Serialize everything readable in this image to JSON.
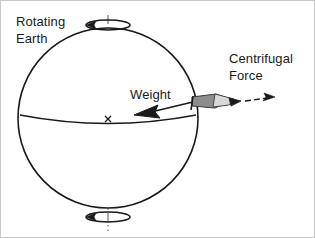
{
  "figure": {
    "background_color": "#ffffff",
    "border_color": "#c8c8c8",
    "line_color": "#1a1a1a"
  },
  "labels": {
    "rotating_earth_line1": "Rotating",
    "rotating_earth_line2": "Earth",
    "weight": "Weight",
    "centrifugal_line1": "Centrifugal",
    "centrifugal_line2": "Force"
  },
  "diagram": {
    "sphere": {
      "name": "Earth",
      "center_x": 107,
      "center_y": 117,
      "radius": 90,
      "stroke": "#1a1a1a"
    },
    "equator": {
      "name": "Equator",
      "start_x": 19,
      "start_y": 117,
      "end_x": 195,
      "end_y": 117,
      "sag": 9
    },
    "rotation_axis": {
      "name": "Rotation axis",
      "x": 107,
      "top_y": 14,
      "bottom_y": 230,
      "style": "dash-dot"
    },
    "center_mark": {
      "name": "Center of Earth",
      "glyph": "x",
      "x": 107,
      "y": 118
    },
    "spin_indicator_top": {
      "name": "Rotation direction top",
      "cx": 107,
      "cy": 24,
      "rx": 22,
      "ry": 5,
      "arrow_side": "left"
    },
    "spin_indicator_bottom": {
      "name": "Rotation direction bottom",
      "cx": 107,
      "cy": 216,
      "rx": 22,
      "ry": 5,
      "arrow_side": "left"
    },
    "weight_vector": {
      "name": "Weight force vector",
      "direction": "inward toward center",
      "tail_x": 196,
      "tail_y": 100,
      "head_x": 137,
      "head_y": 114
    },
    "centrifugal_vector": {
      "name": "Centrifugal force vector",
      "direction": "outward away from axis",
      "tail_x": 237,
      "tail_y": 101,
      "head_x": 272,
      "head_y": 98,
      "style": "dashed"
    },
    "surface_object": {
      "name": "Mass on Earth surface",
      "x": 196,
      "y": 101,
      "fill": "#8c8c8c"
    }
  }
}
